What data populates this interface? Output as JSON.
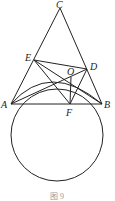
{
  "figure": {
    "caption": "图 9",
    "points": {
      "A": {
        "label": "A",
        "x": 11,
        "y": 104
      },
      "B": {
        "label": "B",
        "x": 102,
        "y": 104
      },
      "C": {
        "label": "C",
        "x": 60,
        "y": 8
      },
      "D": {
        "label": "D",
        "x": 87,
        "y": 69
      },
      "E": {
        "label": "E",
        "x": 34,
        "y": 60
      },
      "F": {
        "label": "F",
        "x": 70,
        "y": 104
      },
      "O": {
        "label": "O",
        "x": 71,
        "y": 77
      }
    },
    "segments": [
      "CA",
      "CB",
      "AB",
      "ED",
      "EB",
      "AD",
      "AO",
      "OF",
      "OB",
      "EF",
      "DF"
    ],
    "circle": {
      "cx": 57,
      "cy": 135,
      "r": 46
    },
    "arc": {
      "from": "A",
      "to": "B",
      "through": "O"
    }
  }
}
